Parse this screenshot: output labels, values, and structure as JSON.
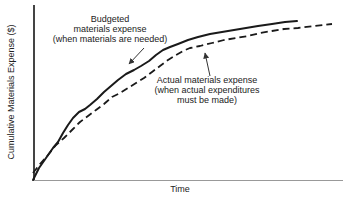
{
  "chart_data": {
    "type": "line",
    "title": "",
    "xlabel": "Time",
    "ylabel": "Cumulative Materials Expense ($)",
    "x_axis": {
      "label": "Time",
      "ticks": [],
      "numeric_scale": "none (conceptual time axis)"
    },
    "y_axis": {
      "label": "Cumulative Materials Expense ($)",
      "ticks": [],
      "numeric_scale": "none (conceptual $ axis)"
    },
    "grid": "off",
    "legend_position": "inline annotations with arrows",
    "series": [
      {
        "name": "Budgeted materials expense (when materials are needed)",
        "annotation_lines": [
          "Budgeted",
          "materials expense",
          "(when materials are needed)"
        ],
        "line_style": "solid",
        "color": "#1a1a1a",
        "points_px": [
          [
            33,
            180
          ],
          [
            39,
            168
          ],
          [
            46,
            158
          ],
          [
            53,
            148
          ],
          [
            58,
            142
          ],
          [
            63,
            133
          ],
          [
            68,
            125
          ],
          [
            73,
            118
          ],
          [
            79,
            112
          ],
          [
            85,
            109
          ],
          [
            90,
            105
          ],
          [
            97,
            99
          ],
          [
            104,
            92
          ],
          [
            111,
            86
          ],
          [
            118,
            80
          ],
          [
            126,
            74
          ],
          [
            134,
            70
          ],
          [
            141,
            66
          ],
          [
            149,
            61
          ],
          [
            156,
            55
          ],
          [
            163,
            50
          ],
          [
            170,
            47
          ],
          [
            178,
            44
          ],
          [
            188,
            40
          ],
          [
            198,
            37
          ],
          [
            210,
            34
          ],
          [
            222,
            32
          ],
          [
            234,
            30
          ],
          [
            246,
            28
          ],
          [
            258,
            26
          ],
          [
            272,
            24
          ],
          [
            285,
            22
          ],
          [
            297,
            21
          ]
        ]
      },
      {
        "name": "Actual materials expense (when actual expenditures must be made)",
        "annotation_lines": [
          "Actual materials expense",
          "(when actual expenditures",
          "must be made)"
        ],
        "line_style": "dashed",
        "color": "#1a1a1a",
        "points_px": [
          [
            33,
            173
          ],
          [
            40,
            164
          ],
          [
            48,
            155
          ],
          [
            56,
            145
          ],
          [
            64,
            138
          ],
          [
            72,
            130
          ],
          [
            80,
            122
          ],
          [
            88,
            116
          ],
          [
            96,
            110
          ],
          [
            104,
            104
          ],
          [
            112,
            97
          ],
          [
            120,
            93
          ],
          [
            128,
            88
          ],
          [
            136,
            83
          ],
          [
            144,
            78
          ],
          [
            152,
            72
          ],
          [
            160,
            66
          ],
          [
            168,
            60
          ],
          [
            176,
            55
          ],
          [
            183,
            51
          ],
          [
            190,
            48
          ],
          [
            200,
            46
          ],
          [
            212,
            43
          ],
          [
            224,
            40
          ],
          [
            236,
            38
          ],
          [
            248,
            36
          ],
          [
            260,
            33
          ],
          [
            272,
            31
          ],
          [
            284,
            29
          ],
          [
            298,
            28
          ],
          [
            314,
            26
          ],
          [
            332,
            24
          ]
        ]
      }
    ],
    "relationship_shown": "Budgeted (solid) curve rises above actual (dashed) curve after an early crossing near the origin; both rise steeply then flatten toward the right"
  },
  "colors": {
    "background": "#ffffff",
    "curve": "#1a1a1a",
    "y_axis": "#444444",
    "x_axis": "#999999",
    "text": "#222222",
    "arrow": "#333333"
  }
}
